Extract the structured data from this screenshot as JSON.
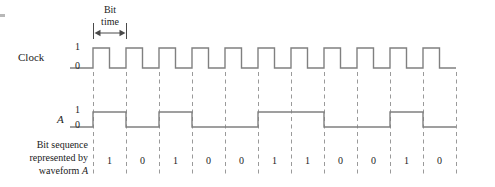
{
  "figure": {
    "type": "digital-timing-diagram",
    "background_color": "#ffffff",
    "line_color": "#808080",
    "dash_color": "#9a9a9a",
    "text_color": "#1d1d1d"
  },
  "annotations": {
    "bit_time_label_line1": "Bit",
    "bit_time_label_line2": "time",
    "caption_line1": "Bit sequence",
    "caption_line2": "represented by",
    "caption_line3_prefix": "waveform ",
    "caption_line3_signal": "A"
  },
  "signals": [
    {
      "name": "Clock",
      "label": "Clock",
      "level_high_label": "1",
      "level_low_label": "0",
      "waveform": "square",
      "pulse_count": 11,
      "duty_cycle": 0.5
    },
    {
      "name": "A",
      "label": "A",
      "level_high_label": "1",
      "level_low_label": "0",
      "waveform": "data"
    }
  ],
  "chart_data": {
    "type": "line",
    "xlabel": "",
    "ylabel": "",
    "grid": true,
    "legend": "none",
    "bit_period_px": 33,
    "origin_x_px": 93,
    "bit_count": 11,
    "categories": [
      "1",
      "2",
      "3",
      "4",
      "5",
      "6",
      "7",
      "8",
      "9",
      "10",
      "11"
    ],
    "series": [
      {
        "name": "Clock",
        "values": [
          1,
          1,
          1,
          1,
          1,
          1,
          1,
          1,
          1,
          1,
          1
        ]
      },
      {
        "name": "A",
        "values": [
          1,
          0,
          1,
          0,
          0,
          1,
          1,
          0,
          0,
          1,
          0
        ]
      }
    ],
    "bit_sequence": [
      "1",
      "0",
      "1",
      "0",
      "0",
      "1",
      "1",
      "0",
      "0",
      "1",
      "0"
    ]
  }
}
